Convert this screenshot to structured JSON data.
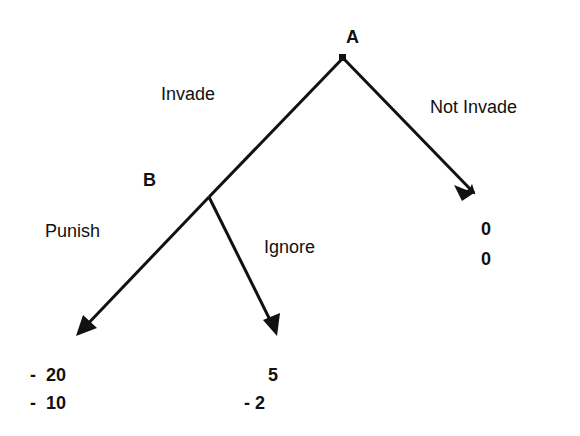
{
  "nodes": {
    "a": {
      "label": "A"
    },
    "b": {
      "label": "B"
    }
  },
  "branches": {
    "invade": "Invade",
    "not_invade": "Not Invade",
    "punish": "Punish",
    "ignore": "Ignore"
  },
  "payoffs": {
    "punish": {
      "a": "-  20",
      "b": "-  10"
    },
    "ignore": {
      "a": "5",
      "b": "- 2"
    },
    "not_invade": {
      "a": "0",
      "b": "0"
    }
  }
}
